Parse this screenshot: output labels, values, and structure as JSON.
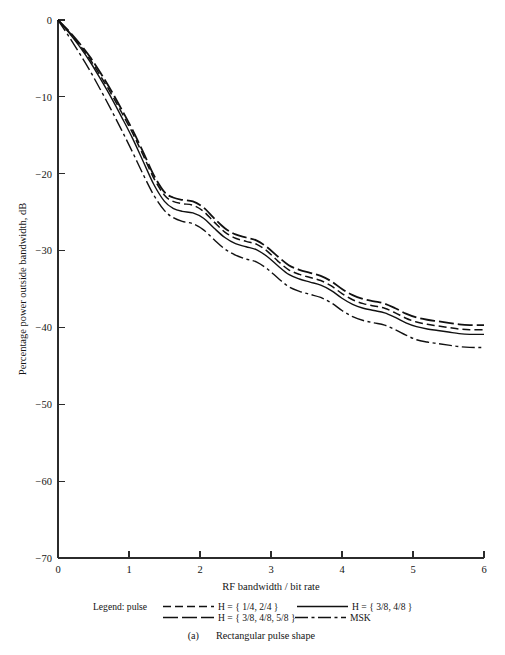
{
  "figure": {
    "caption_index": "(a)",
    "caption_text": "Rectangular pulse shape",
    "legend_prefix": "Legend: pulse"
  },
  "chart_data": {
    "type": "line",
    "title": "",
    "xlabel": "RF bandwidth / bit rate",
    "ylabel": "Percentage power outside bandwidth, dB",
    "xlim": [
      0,
      6
    ],
    "ylim": [
      -70,
      0
    ],
    "xticks": [
      0,
      1,
      2,
      3,
      4,
      5,
      6
    ],
    "xtick_labels": [
      "0",
      "1",
      "2",
      "3",
      "4",
      "5",
      "6"
    ],
    "yticks": [
      0,
      -10,
      -20,
      -30,
      -40,
      -50,
      -60,
      -70
    ],
    "ytick_labels": [
      "0",
      "−10",
      "−20",
      "−30",
      "−40",
      "−50",
      "−60",
      "−70"
    ],
    "grid": false,
    "legend_position": "below-axes",
    "series": [
      {
        "name": "H = { 1/4, 2/4 }",
        "label": "H = { 1/4, 2/4 }",
        "linestyle": "dashed",
        "dasharray": "9,4",
        "linewidth": 1.5,
        "color": "#111111",
        "x": [
          0.0,
          0.15,
          0.3,
          0.45,
          0.6,
          0.75,
          0.9,
          1.05,
          1.2,
          1.35,
          1.5,
          1.62,
          1.75,
          1.9,
          2.05,
          2.2,
          2.35,
          2.5,
          2.65,
          2.8,
          2.95,
          3.1,
          3.25,
          3.4,
          3.55,
          3.7,
          3.85,
          4.0,
          4.15,
          4.3,
          4.45,
          4.6,
          4.75,
          4.9,
          5.05,
          5.2,
          5.35,
          5.5,
          5.65,
          5.8,
          6.0
        ],
        "y": [
          0.0,
          -1.5,
          -3.2,
          -5.1,
          -7.3,
          -9.6,
          -12.1,
          -14.7,
          -17.6,
          -20.6,
          -22.8,
          -23.6,
          -23.9,
          -24.1,
          -24.9,
          -26.3,
          -27.6,
          -28.4,
          -28.8,
          -29.2,
          -30.1,
          -31.4,
          -32.5,
          -33.1,
          -33.5,
          -33.9,
          -34.6,
          -35.6,
          -36.4,
          -36.9,
          -37.2,
          -37.5,
          -38.1,
          -38.8,
          -39.3,
          -39.6,
          -39.8,
          -40.0,
          -40.2,
          -40.3,
          -40.3
        ]
      },
      {
        "name": "H = { 3/8, 4/8 }",
        "label": "H = { 3/8, 4/8 }",
        "linestyle": "solid",
        "dasharray": "none",
        "linewidth": 1.4,
        "color": "#111111",
        "x": [
          0.0,
          0.15,
          0.3,
          0.45,
          0.6,
          0.75,
          0.9,
          1.05,
          1.2,
          1.35,
          1.5,
          1.62,
          1.75,
          1.9,
          2.05,
          2.2,
          2.35,
          2.5,
          2.65,
          2.8,
          2.95,
          3.1,
          3.25,
          3.4,
          3.55,
          3.7,
          3.85,
          4.0,
          4.15,
          4.3,
          4.45,
          4.6,
          4.75,
          4.9,
          5.05,
          5.2,
          5.35,
          5.5,
          5.65,
          5.8,
          6.0
        ],
        "y": [
          0.0,
          -1.6,
          -3.4,
          -5.4,
          -7.7,
          -10.1,
          -12.7,
          -15.4,
          -18.4,
          -21.4,
          -23.6,
          -24.5,
          -24.9,
          -25.1,
          -25.8,
          -27.1,
          -28.3,
          -29.1,
          -29.5,
          -29.9,
          -30.8,
          -32.0,
          -33.1,
          -33.7,
          -34.1,
          -34.5,
          -35.2,
          -36.2,
          -37.0,
          -37.5,
          -37.8,
          -38.1,
          -38.7,
          -39.4,
          -39.9,
          -40.2,
          -40.4,
          -40.6,
          -40.8,
          -40.9,
          -40.9
        ]
      },
      {
        "name": "H = { 3/8, 4/8, 5/8 }",
        "label": "H = { 3/8, 4/8, 5/8 }",
        "linestyle": "long-dash",
        "dasharray": "16,5",
        "linewidth": 1.8,
        "color": "#111111",
        "x": [
          0.0,
          0.15,
          0.3,
          0.45,
          0.6,
          0.75,
          0.9,
          1.05,
          1.2,
          1.35,
          1.5,
          1.62,
          1.75,
          1.9,
          2.05,
          2.2,
          2.35,
          2.5,
          2.65,
          2.8,
          2.95,
          3.1,
          3.25,
          3.4,
          3.55,
          3.7,
          3.85,
          4.0,
          4.15,
          4.3,
          4.45,
          4.6,
          4.75,
          4.9,
          5.05,
          5.2,
          5.35,
          5.5,
          5.65,
          5.8,
          6.0
        ],
        "y": [
          0.0,
          -1.4,
          -3.0,
          -4.8,
          -6.9,
          -9.2,
          -11.7,
          -14.3,
          -17.2,
          -20.2,
          -22.4,
          -23.1,
          -23.4,
          -23.6,
          -24.4,
          -25.8,
          -27.1,
          -27.9,
          -28.3,
          -28.7,
          -29.6,
          -30.8,
          -31.9,
          -32.5,
          -32.9,
          -33.3,
          -34.0,
          -35.0,
          -35.8,
          -36.3,
          -36.6,
          -36.9,
          -37.5,
          -38.2,
          -38.7,
          -39.0,
          -39.2,
          -39.4,
          -39.6,
          -39.7,
          -39.7
        ]
      },
      {
        "name": "MSK",
        "label": "MSK",
        "linestyle": "dash-dot",
        "dasharray": "11,4",
        "linewidth": 1.4,
        "color": "#111111",
        "x": [
          0.0,
          0.15,
          0.3,
          0.45,
          0.6,
          0.75,
          0.9,
          1.05,
          1.2,
          1.35,
          1.5,
          1.62,
          1.75,
          1.9,
          2.05,
          2.2,
          2.35,
          2.5,
          2.65,
          2.8,
          2.95,
          3.1,
          3.25,
          3.4,
          3.55,
          3.7,
          3.85,
          4.0,
          4.15,
          4.3,
          4.45,
          4.6,
          4.75,
          4.9,
          5.05,
          5.2,
          5.35,
          5.5,
          5.65,
          5.8,
          6.0
        ],
        "y": [
          0.0,
          -2.1,
          -4.3,
          -6.6,
          -9.1,
          -11.7,
          -14.4,
          -17.2,
          -20.1,
          -22.8,
          -24.8,
          -25.7,
          -26.2,
          -26.5,
          -27.3,
          -28.6,
          -29.8,
          -30.6,
          -31.1,
          -31.5,
          -32.4,
          -33.6,
          -34.7,
          -35.3,
          -35.7,
          -36.1,
          -36.8,
          -37.8,
          -38.6,
          -39.1,
          -39.4,
          -39.7,
          -40.3,
          -41.0,
          -41.6,
          -41.9,
          -42.1,
          -42.3,
          -42.5,
          -42.6,
          -42.6
        ]
      }
    ],
    "legend_entries": [
      {
        "label": "H = { 1/4, 2/4 }",
        "style": "dashed",
        "row": 0,
        "col": 0
      },
      {
        "label": "H = { 3/8, 4/8 }",
        "style": "solid",
        "row": 0,
        "col": 1
      },
      {
        "label": "H = { 3/8, 4/8, 5/8 }",
        "style": "long-dash",
        "row": 1,
        "col": 0
      },
      {
        "label": "MSK",
        "style": "dash-dot",
        "row": 1,
        "col": 1
      }
    ]
  }
}
